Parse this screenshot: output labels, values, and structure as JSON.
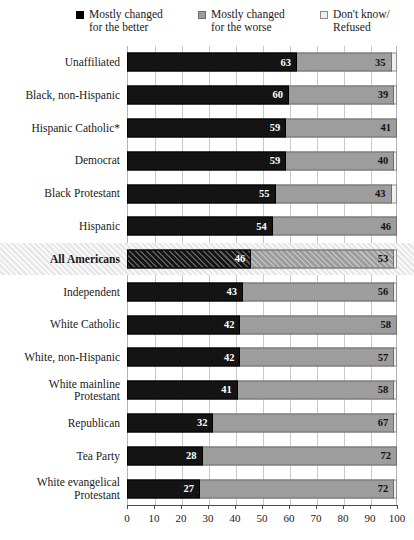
{
  "chart_data": {
    "type": "bar",
    "orientation": "horizontal",
    "stacked": true,
    "title": "",
    "xlabel": "",
    "ylabel": "",
    "xlim": [
      0,
      100
    ],
    "xticks": [
      0,
      10,
      20,
      30,
      40,
      50,
      60,
      70,
      80,
      90,
      100
    ],
    "grid": true,
    "legend_position": "top",
    "legend": [
      {
        "label": "Mostly changed\nfor the better",
        "color": "#000000",
        "key": "better"
      },
      {
        "label": "Mostly changed\nfor the worse",
        "color": "#9d9d9d",
        "key": "worse"
      },
      {
        "label": "Don't know/\nRefused",
        "color": "#efefef",
        "key": "dk"
      }
    ],
    "categories": [
      "Unaffiliated",
      "Black, non-Hispanic",
      "Hispanic Catholic*",
      "Democrat",
      "Black Protestant",
      "Hispanic",
      "All Americans",
      "Independent",
      "White Catholic",
      "White, non-Hispanic",
      "White mainline\nProtestant",
      "Republican",
      "Tea Party",
      "White evangelical\nProtestant"
    ],
    "highlight_category": "All Americans",
    "series": [
      {
        "name": "Mostly changed for the better",
        "values": [
          63,
          60,
          59,
          59,
          55,
          54,
          46,
          43,
          42,
          42,
          41,
          32,
          28,
          27
        ]
      },
      {
        "name": "Mostly changed for the worse",
        "values": [
          35,
          39,
          41,
          40,
          43,
          46,
          53,
          56,
          58,
          57,
          58,
          67,
          72,
          72
        ]
      },
      {
        "name": "Don't know/Refused",
        "values": [
          2,
          1,
          0,
          1,
          2,
          0,
          1,
          1,
          0,
          1,
          1,
          1,
          0,
          1
        ]
      }
    ],
    "rows": [
      {
        "label": "Unaffiliated",
        "better": 63,
        "worse": 35,
        "dk": 2,
        "highlight": false
      },
      {
        "label": "Black, non-Hispanic",
        "better": 60,
        "worse": 39,
        "dk": 1,
        "highlight": false
      },
      {
        "label": "Hispanic Catholic*",
        "better": 59,
        "worse": 41,
        "dk": 0,
        "highlight": false
      },
      {
        "label": "Democrat",
        "better": 59,
        "worse": 40,
        "dk": 1,
        "highlight": false
      },
      {
        "label": "Black Protestant",
        "better": 55,
        "worse": 43,
        "dk": 2,
        "highlight": false
      },
      {
        "label": "Hispanic",
        "better": 54,
        "worse": 46,
        "dk": 0,
        "highlight": false
      },
      {
        "label": "All Americans",
        "better": 46,
        "worse": 53,
        "dk": 1,
        "highlight": true
      },
      {
        "label": "Independent",
        "better": 43,
        "worse": 56,
        "dk": 1,
        "highlight": false
      },
      {
        "label": "White Catholic",
        "better": 42,
        "worse": 58,
        "dk": 0,
        "highlight": false
      },
      {
        "label": "White, non-Hispanic",
        "better": 42,
        "worse": 57,
        "dk": 1,
        "highlight": false
      },
      {
        "label": "White mainline\nProtestant",
        "better": 41,
        "worse": 58,
        "dk": 1,
        "highlight": false
      },
      {
        "label": "Republican",
        "better": 32,
        "worse": 67,
        "dk": 1,
        "highlight": false
      },
      {
        "label": "Tea Party",
        "better": 28,
        "worse": 72,
        "dk": 0,
        "highlight": false
      },
      {
        "label": "White evangelical\nProtestant",
        "better": 27,
        "worse": 72,
        "dk": 1,
        "highlight": false
      }
    ]
  },
  "colors": {
    "better": "#141414",
    "worse": "#9d9d9d",
    "dk": "#f0f0f0",
    "highlight_band": "#e6e6e6",
    "gridline": "#c9c9c9",
    "axis": "#4a4a4a"
  }
}
